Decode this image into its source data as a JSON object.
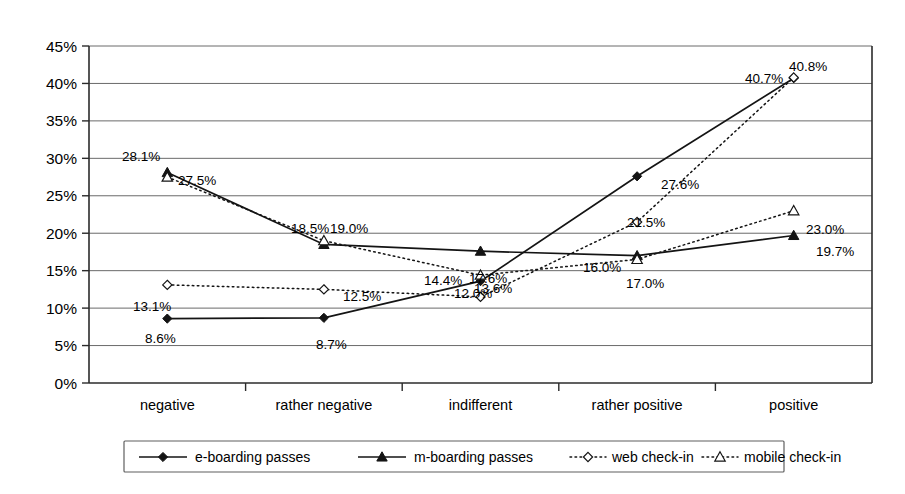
{
  "chart_data": {
    "type": "line",
    "title": "",
    "xlabel": "",
    "ylabel": "",
    "categories": [
      "negative",
      "rather negative",
      "indifferent",
      "rather positive",
      "positive"
    ],
    "ylim": [
      0,
      45
    ],
    "ytick_step": 5,
    "ytick_labels": [
      "0%",
      "5%",
      "10%",
      "15%",
      "20%",
      "25%",
      "30%",
      "35%",
      "40%",
      "45%"
    ],
    "ytick_values": [
      0,
      5,
      10,
      15,
      20,
      25,
      30,
      35,
      40,
      45
    ],
    "grid": true,
    "legend_position": "bottom",
    "series": [
      {
        "name": "e-boarding passes",
        "marker": "filled-diamond",
        "line": "solid",
        "color": "#141414",
        "values": [
          8.6,
          8.7,
          13.6,
          27.6,
          40.7
        ],
        "labels": [
          "8.6%",
          "8.7%",
          "13.6%",
          "27.6%",
          "40.7%"
        ]
      },
      {
        "name": "m-boarding passes",
        "marker": "filled-triangle",
        "line": "solid",
        "color": "#141414",
        "values": [
          28.1,
          18.5,
          17.6,
          17.0,
          19.7
        ],
        "labels": [
          "28.1%",
          "18.5%",
          "17.6%",
          "17.0%",
          "19.7%"
        ]
      },
      {
        "name": "web check-in",
        "marker": "open-diamond",
        "line": "dotted",
        "color": "#141414",
        "values": [
          13.1,
          12.5,
          11.5,
          21.5,
          40.8
        ],
        "labels": [
          "13.1%",
          "12.5%",
          "12.0%",
          "21.5%",
          "40.8%"
        ]
      },
      {
        "name": "mobile check-in",
        "marker": "open-triangle",
        "line": "dotted",
        "color": "#141414",
        "values": [
          27.5,
          19.0,
          14.4,
          16.5,
          23.0
        ],
        "labels": [
          "27.5%",
          "19.0%",
          "14.4%",
          "16.5%",
          "23.0%"
        ]
      }
    ],
    "point_label_positions": [
      {
        "series": 1,
        "index": 0,
        "text": "28.1%",
        "x": 122,
        "y": 161
      },
      {
        "series": 1,
        "index": 1,
        "text": "18.5%",
        "x": 291,
        "y": 233
      },
      {
        "series": 3,
        "index": 1,
        "text": "19.0%",
        "x": 330,
        "y": 233
      },
      {
        "series": 3,
        "index": 0,
        "text": "27.5%",
        "x": 178,
        "y": 185
      },
      {
        "series": 3,
        "index": 2,
        "text": "14.4%",
        "x": 424,
        "y": 285
      },
      {
        "series": 1,
        "index": 2,
        "text": "17.6%",
        "x": 469,
        "y": 283
      },
      {
        "series": 0,
        "index": 2,
        "text": "13.6%",
        "x": 474,
        "y": 293
      },
      {
        "series": 2,
        "index": 2,
        "text": "12.0%",
        "x": 454,
        "y": 298
      },
      {
        "series": 0,
        "index": 0,
        "text": "8.6%",
        "x": 145,
        "y": 343
      },
      {
        "series": 0,
        "index": 1,
        "text": "8.7%",
        "x": 316,
        "y": 349
      },
      {
        "series": 2,
        "index": 0,
        "text": "13.1%",
        "x": 133,
        "y": 311
      },
      {
        "series": 2,
        "index": 1,
        "text": "12.5%",
        "x": 343,
        "y": 301
      },
      {
        "series": 0,
        "index": 3,
        "text": "27.6%",
        "x": 661,
        "y": 189
      },
      {
        "series": 2,
        "index": 3,
        "text": "21.5%",
        "x": 627,
        "y": 227
      },
      {
        "series": 3,
        "index": 3,
        "text": "16.0%",
        "x": 583,
        "y": 272
      },
      {
        "series": 1,
        "index": 3,
        "text": "17.0%",
        "x": 626,
        "y": 288
      },
      {
        "series": 0,
        "index": 4,
        "text": "40.7%",
        "x": 745,
        "y": 83
      },
      {
        "series": 2,
        "index": 4,
        "text": "40.8%",
        "x": 789,
        "y": 71
      },
      {
        "series": 3,
        "index": 4,
        "text": "23.0%",
        "x": 806,
        "y": 234
      },
      {
        "series": 1,
        "index": 4,
        "text": "19.7%",
        "x": 816,
        "y": 256
      }
    ]
  },
  "legend": {
    "items": [
      {
        "label": "e-boarding passes",
        "marker": "filled-diamond",
        "line": "solid"
      },
      {
        "label": "m-boarding passes",
        "marker": "filled-triangle",
        "line": "solid"
      },
      {
        "label": "web check-in",
        "marker": "open-diamond",
        "line": "dotted"
      },
      {
        "label": "mobile check-in",
        "marker": "open-triangle",
        "line": "dotted"
      }
    ]
  }
}
